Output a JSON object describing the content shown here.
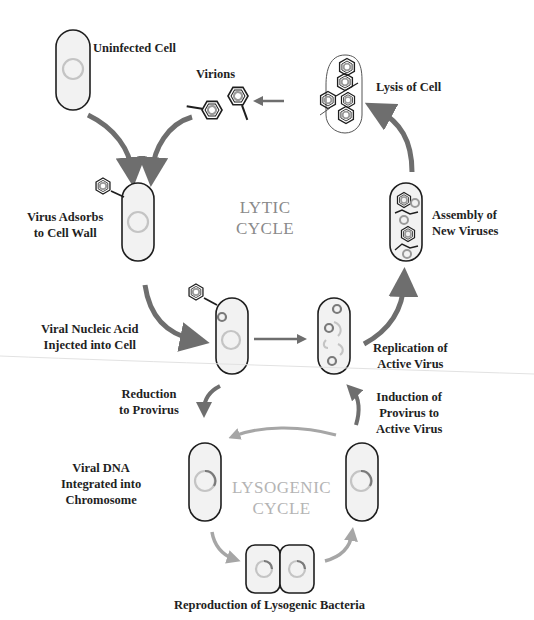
{
  "diagram": {
    "colors": {
      "arrow_lytic": "#6e6e6e",
      "arrow_lysogenic": "#a6a6a6",
      "cell_outline": "#1e1e1e",
      "cell_fill": "#f2f2f2",
      "chromosome": "#c4c4c4",
      "viral_dna": "#7a7a7a",
      "lytic_label": "#8a8a8a",
      "lysogenic_label": "#b4b4b4"
    },
    "cycles": {
      "lytic": [
        "LYTIC",
        "CYCLE"
      ],
      "lysogenic": [
        "LYSOGENIC",
        "CYCLE"
      ]
    },
    "stages": {
      "uninfected": "Uninfected Cell",
      "virions": "Virions",
      "lysis": "Lysis of Cell",
      "adsorbs": [
        "Virus Adsorbs",
        "to Cell Wall"
      ],
      "assembly": [
        "Assembly of",
        "New Viruses"
      ],
      "injected": [
        "Viral Nucleic Acid",
        "Injected into Cell"
      ],
      "replication": [
        "Replication of",
        "Active Virus"
      ],
      "reduction": [
        "Reduction",
        "to Provirus"
      ],
      "induction": [
        "Induction of",
        "Provirus to",
        "Active Virus"
      ],
      "integrated": [
        "Viral DNA",
        "Integrated into",
        "Chromosome"
      ],
      "reproduction": "Reproduction of Lysogenic Bacteria"
    }
  }
}
